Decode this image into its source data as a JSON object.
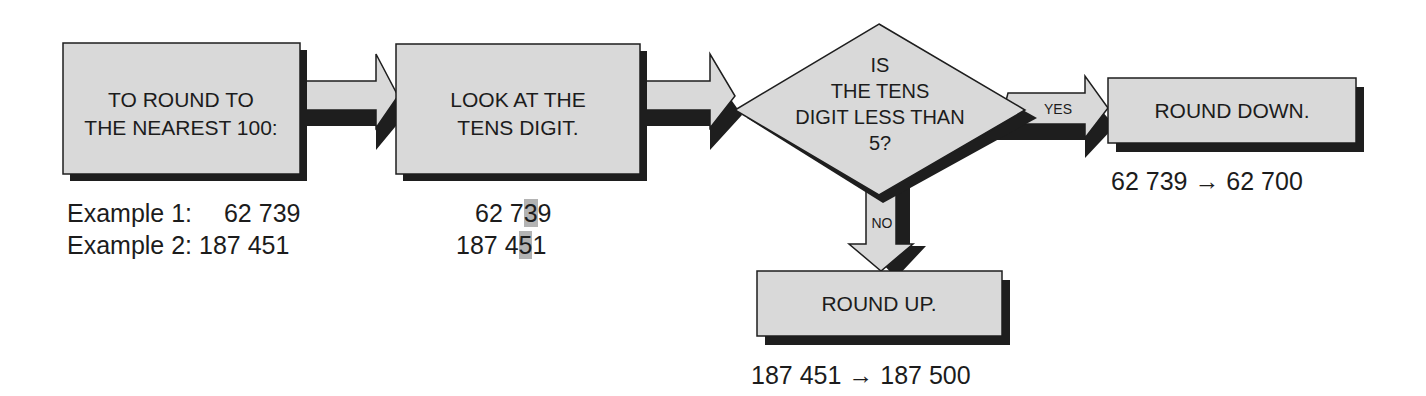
{
  "diagram": {
    "colors": {
      "fill": "#d9d9d9",
      "shadow": "#1e1e1e",
      "stroke": "#1e1e1e",
      "highlight": "#b3b3b3",
      "text": "#1c1c1c"
    },
    "nodes": {
      "start": {
        "line1": "TO ROUND TO",
        "line2": "THE NEAREST 100:"
      },
      "step": {
        "line1": "LOOK AT THE",
        "line2": "TENS DIGIT."
      },
      "decision": {
        "line1": "IS",
        "line2": "THE  TENS",
        "line3": "DIGIT LESS THAN",
        "line4": "5?"
      },
      "round_down": {
        "label": "ROUND DOWN."
      },
      "round_up": {
        "label": "ROUND UP."
      }
    },
    "edges": {
      "yes_label": "YES",
      "no_label": "NO"
    },
    "examples": {
      "ex1_label": "Example 1:",
      "ex1_value": "62 739",
      "ex2_label": "Example 2:",
      "ex2_value": "187 451",
      "ex1_tens_prefix": "62 7",
      "ex1_tens_digit": "3",
      "ex1_tens_suffix": "9",
      "ex2_tens_prefix": "187 4",
      "ex2_tens_digit": "5",
      "ex2_tens_suffix": "1",
      "round_down_result": "62 739 → 62 700",
      "round_up_result": "187 451 → 187 500"
    }
  }
}
